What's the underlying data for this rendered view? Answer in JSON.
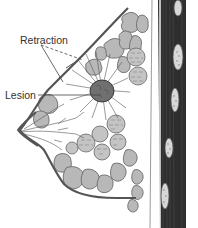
{
  "figure": {
    "labels": {
      "retraction": "Retraction",
      "lesion": "Lesion"
    }
  },
  "colors": {
    "background": "#ffffff",
    "outline": "#555555",
    "lobule_fill": "#b8b8b8",
    "lobule_stroke": "#6a6a6a",
    "lesion_fill": "#707070",
    "muscle": "#2e2e2e",
    "muscle_stripe": "#4a4a4a",
    "rib_fill": "#d8d8d8",
    "label_text": "#333333",
    "leader_line": "#444444"
  }
}
